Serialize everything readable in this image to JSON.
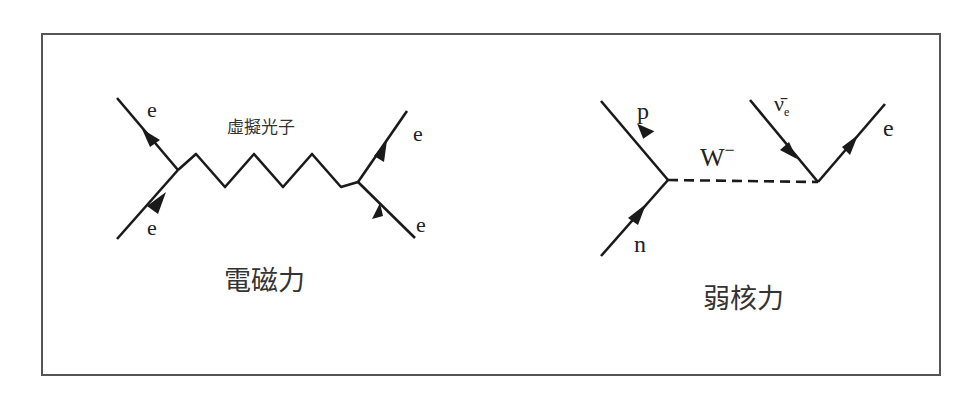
{
  "electromagnetic": {
    "title": "電磁力",
    "propagator_label": "虛擬光子",
    "particles": {
      "top_left": "e",
      "bottom_left": "e",
      "top_right": "e",
      "bottom_right": "e"
    }
  },
  "weak": {
    "title": "弱核力",
    "propagator_label": "W",
    "propagator_charge": "−",
    "particles": {
      "top_left": "p",
      "bottom_left": "n",
      "antineutrino": "ν̄",
      "antineutrino_sub": "e",
      "top_right": "e"
    }
  },
  "colors": {
    "line": "#1a1a1a",
    "frame": "#555555",
    "text": "#333333"
  }
}
